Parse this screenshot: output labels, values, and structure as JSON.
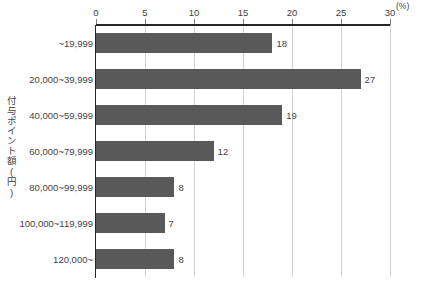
{
  "chart_data": {
    "type": "bar",
    "orientation": "horizontal",
    "title": "",
    "xlabel": "(%)",
    "ylabel": "付与ポイント額(円)",
    "categories": [
      "~19,999",
      "20,000~39,999",
      "40,000~59,999",
      "60,000~79,999",
      "80,000~99,999",
      "100,000~119,999",
      "120,000~"
    ],
    "values": [
      18,
      27,
      19,
      12,
      8,
      7,
      8
    ],
    "value_labels": [
      "18",
      "27",
      "19",
      "12",
      "8",
      "7",
      "8"
    ],
    "xlim": [
      0,
      30
    ],
    "xticks": [
      0,
      5,
      10,
      15,
      20,
      25,
      30
    ],
    "xtick_labels": [
      "0",
      "5",
      "10",
      "15",
      "20",
      "25",
      "30"
    ],
    "grid": true,
    "grid_axis": "x",
    "legend": false,
    "unit": "(%)",
    "colors": {
      "bar": "#595959",
      "gridline": "#d4d4d4",
      "axis": "#262626",
      "text": "#3f3f3f",
      "background": "#ffffff"
    }
  }
}
